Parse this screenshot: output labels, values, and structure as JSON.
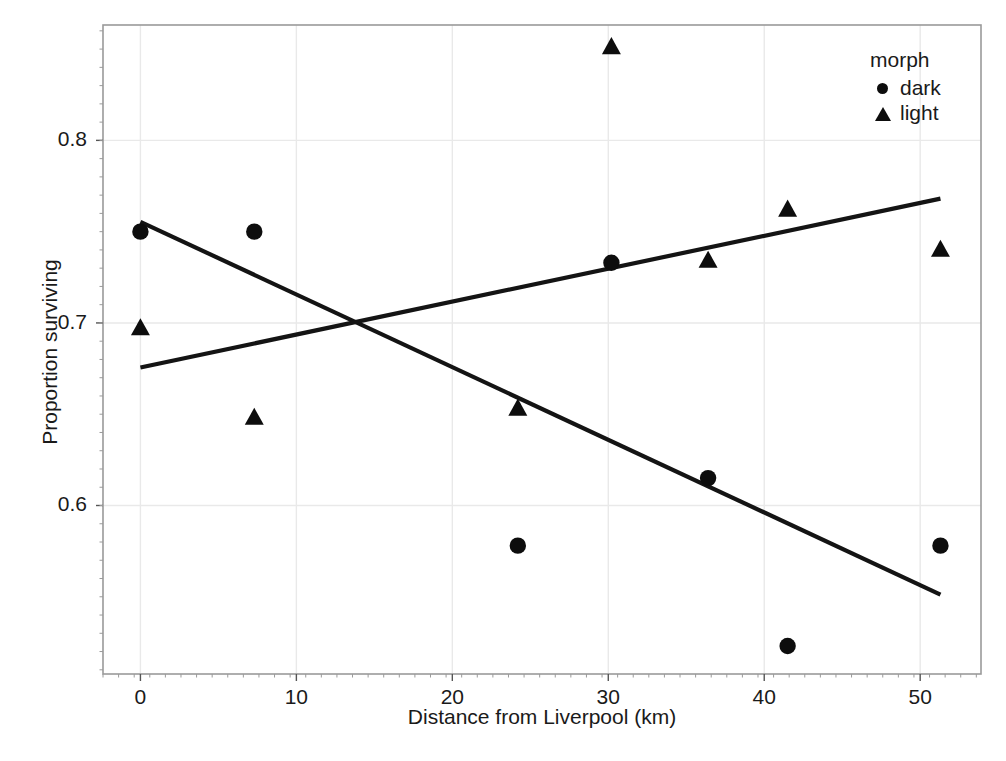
{
  "chart_data": {
    "type": "scatter",
    "title": "",
    "xlabel": "Distance from Liverpool (km)",
    "ylabel": "Proportion surviving",
    "xlim": [
      -2.4,
      53.9
    ],
    "ylim": [
      0.5077,
      0.8632
    ],
    "xticks": [
      0,
      10,
      20,
      30,
      40,
      50
    ],
    "xticklabels": [
      "0",
      "10",
      "20",
      "30",
      "40",
      "50"
    ],
    "yticks": [
      0.6,
      0.7,
      0.8
    ],
    "yticklabels": [
      "0.6",
      "0.7",
      "0.8"
    ],
    "grid": true,
    "legend": {
      "title": "morph",
      "position": "top-right",
      "entries": [
        {
          "label": "dark",
          "marker": "circle"
        },
        {
          "label": "light",
          "marker": "triangle"
        }
      ]
    },
    "series": [
      {
        "name": "dark",
        "marker": "circle",
        "color": "#0d0d0d",
        "points": [
          {
            "x": 0.0,
            "y": 0.75
          },
          {
            "x": 7.3,
            "y": 0.75
          },
          {
            "x": 24.2,
            "y": 0.578
          },
          {
            "x": 30.2,
            "y": 0.733
          },
          {
            "x": 36.4,
            "y": 0.615
          },
          {
            "x": 41.5,
            "y": 0.523
          },
          {
            "x": 51.3,
            "y": 0.578
          }
        ],
        "fit_line": {
          "x0": 0.0,
          "y0": 0.7554,
          "x1": 51.3,
          "y1": 0.5512
        }
      },
      {
        "name": "light",
        "marker": "triangle",
        "color": "#0d0d0d",
        "points": [
          {
            "x": 0.0,
            "y": 0.697
          },
          {
            "x": 7.3,
            "y": 0.648
          },
          {
            "x": 24.2,
            "y": 0.653
          },
          {
            "x": 30.2,
            "y": 0.851
          },
          {
            "x": 36.4,
            "y": 0.734
          },
          {
            "x": 41.5,
            "y": 0.762
          },
          {
            "x": 51.3,
            "y": 0.74
          }
        ],
        "fit_line": {
          "x0": 0.0,
          "y0": 0.6756,
          "x1": 51.3,
          "y1": 0.7681
        }
      }
    ]
  },
  "axes": {
    "x_title": "Distance from Liverpool (km)",
    "y_title": "Proportion surviving"
  },
  "legend": {
    "title": "morph",
    "dark_label": "dark",
    "light_label": "light"
  },
  "colors": {
    "marker": "#0d0d0d",
    "line": "#141414",
    "grid": "#e9e9e9",
    "panel_border": "#9a9a9a",
    "text": "#1a1a1a",
    "background": "#ffffff"
  }
}
